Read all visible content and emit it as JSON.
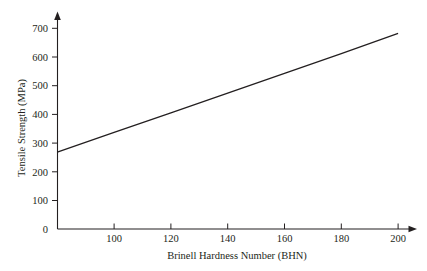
{
  "chart_data": {
    "type": "line",
    "title": "",
    "subtitle": "",
    "xlabel": "Brinell Hardness Number (BHN)",
    "ylabel": "Tensile Strength (MPa)",
    "xlim": [
      80,
      202
    ],
    "ylim": [
      0,
      730
    ],
    "xticks": [
      100,
      120,
      140,
      160,
      180,
      200
    ],
    "xtick_labels": [
      "100",
      "120",
      "140",
      "160",
      "180",
      "200"
    ],
    "yticks": [
      0,
      100,
      200,
      300,
      400,
      500,
      600,
      700
    ],
    "ytick_labels": [
      "0",
      "100",
      "200",
      "300",
      "400",
      "500",
      "600",
      "700"
    ],
    "grid": false,
    "legend": null,
    "annotations": [],
    "series": [
      {
        "name": "Tensile strength vs hardness",
        "color": "#231f20",
        "style": "solid",
        "x": [
          80,
          100,
          120,
          140,
          160,
          180,
          200
        ],
        "values": [
          268,
          337,
          405,
          474,
          543,
          612,
          682
        ]
      }
    ],
    "axis_style": {
      "arrow_x": true,
      "arrow_y": true,
      "ytick_direction": "outward",
      "xtick_direction": "inward",
      "line_color": "#231f20",
      "background": "#ffffff"
    }
  },
  "labels": {
    "y_700": "700",
    "y_600": "600",
    "y_500": "500",
    "y_400": "400",
    "y_300": "300",
    "y_200": "200",
    "y_100": "100",
    "y_0": "0",
    "x_100": "100",
    "x_120": "120",
    "x_140": "140",
    "x_160": "160",
    "x_180": "180",
    "x_200": "200",
    "x_axis_title": "Brinell Hardness Number (BHN)",
    "y_axis_title": "Tensile Strength (MPa)"
  }
}
